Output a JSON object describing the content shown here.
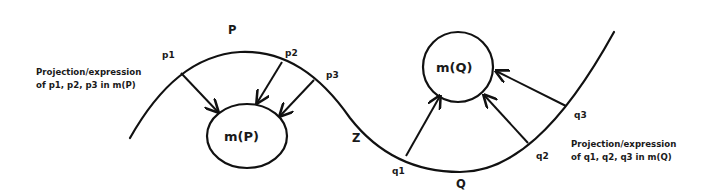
{
  "diagram": {
    "curve": {
      "name": "Z",
      "label": "Z"
    },
    "region_p": {
      "label": "P",
      "points": [
        "p1",
        "p2",
        "p3"
      ],
      "target": "m(P)",
      "caption_line1": "Projection/expression",
      "caption_line2": "of p1, p2, p3 in m(P)"
    },
    "region_q": {
      "label": "Q",
      "points": [
        "q1",
        "q2",
        "q3"
      ],
      "target": "m(Q)",
      "caption_line1": "Projection/expression",
      "caption_line2": "of q1, q2, q3 in m(Q)"
    },
    "colors": {
      "line": "#111111",
      "text": "#1a1a1a",
      "background": "#ffffff"
    }
  }
}
